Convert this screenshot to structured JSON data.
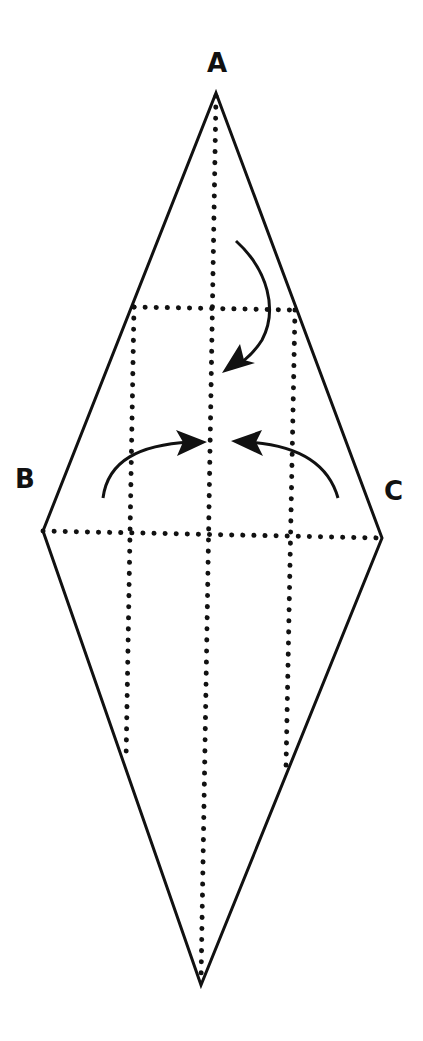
{
  "diagram": {
    "type": "origami-fold-instruction",
    "background": "#ffffff",
    "stroke_color": "#111111",
    "labels": {
      "a": "A",
      "b": "B",
      "c": "C"
    },
    "vertices": {
      "A": [
        216,
        93
      ],
      "B": [
        43,
        531
      ],
      "C": [
        382,
        538
      ],
      "D": [
        201,
        985
      ]
    },
    "fold_lines": [
      {
        "name": "horizontal-diagonal",
        "style": "dotted",
        "from": [
          43,
          531
        ],
        "to": [
          382,
          538
        ]
      },
      {
        "name": "vertical-diagonal",
        "style": "dotted",
        "from": [
          216,
          93
        ],
        "to": [
          201,
          985
        ]
      },
      {
        "name": "upper-horizontal",
        "style": "dotted",
        "from": [
          134,
          307
        ],
        "to": [
          295,
          310
        ]
      },
      {
        "name": "left-vertical",
        "style": "dotted",
        "from": [
          134,
          307
        ],
        "to": [
          126,
          762
        ]
      },
      {
        "name": "right-vertical",
        "style": "dotted",
        "from": [
          295,
          310
        ],
        "to": [
          286,
          768
        ]
      }
    ],
    "arrows": [
      {
        "name": "top-fold-arrow",
        "direction": "down",
        "target": "center"
      },
      {
        "name": "left-fold-arrow",
        "direction": "right",
        "target": "center-line"
      },
      {
        "name": "right-fold-arrow",
        "direction": "left",
        "target": "center-line"
      }
    ]
  }
}
